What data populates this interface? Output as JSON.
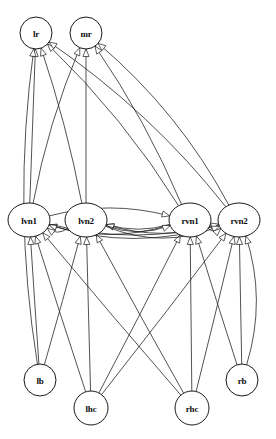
{
  "diagram": {
    "type": "directed-graph",
    "background_color": "#ffffff",
    "stroke_color": "#1a1a1a",
    "node_fill_color": "#ffffff",
    "node_radius": 16,
    "arrowhead_style": "open-triangle",
    "width": 276,
    "height": 439
  },
  "nodes": [
    {
      "id": "lr",
      "label": "lr",
      "x": 36,
      "y": 33,
      "rx": 16,
      "ry": 16,
      "row": "top"
    },
    {
      "id": "mr",
      "label": "mr",
      "x": 86,
      "y": 33,
      "rx": 16,
      "ry": 16,
      "row": "top"
    },
    {
      "id": "lvn1",
      "label": "lvn1",
      "x": 29,
      "y": 220,
      "rx": 21,
      "ry": 17,
      "row": "middle"
    },
    {
      "id": "lvn2",
      "label": "lvn2",
      "x": 86,
      "y": 220,
      "rx": 21,
      "ry": 17,
      "row": "middle"
    },
    {
      "id": "rvn1",
      "label": "rvn1",
      "x": 190,
      "y": 220,
      "rx": 21,
      "ry": 17,
      "row": "middle"
    },
    {
      "id": "rvn2",
      "label": "rvn2",
      "x": 239,
      "y": 220,
      "rx": 21,
      "ry": 17,
      "row": "middle"
    },
    {
      "id": "lb",
      "label": "lb",
      "x": 40,
      "y": 380,
      "rx": 16,
      "ry": 16,
      "row": "bottom"
    },
    {
      "id": "lhc",
      "label": "lhc",
      "x": 91,
      "y": 408,
      "rx": 17,
      "ry": 17,
      "row": "bottom"
    },
    {
      "id": "rhc",
      "label": "rhc",
      "x": 192,
      "y": 408,
      "rx": 17,
      "ry": 17,
      "row": "bottom"
    },
    {
      "id": "rb",
      "label": "rb",
      "x": 242,
      "y": 380,
      "rx": 16,
      "ry": 16,
      "row": "bottom"
    }
  ],
  "edges": [
    {
      "from": "lvn1",
      "to": "lr",
      "curve": 0
    },
    {
      "from": "lvn2",
      "to": "lr",
      "curve": 6
    },
    {
      "from": "rvn1",
      "to": "lr",
      "curve": 14
    },
    {
      "from": "rvn2",
      "to": "lr",
      "curve": 20
    },
    {
      "from": "lvn1",
      "to": "mr",
      "curve": -10
    },
    {
      "from": "lvn2",
      "to": "mr",
      "curve": 0
    },
    {
      "from": "rvn1",
      "to": "mr",
      "curve": 10
    },
    {
      "from": "rvn2",
      "to": "mr",
      "curve": 22
    },
    {
      "from": "lb",
      "to": "lr",
      "curve": -26
    },
    {
      "from": "lb",
      "to": "lvn1",
      "curve": 0
    },
    {
      "from": "lb",
      "to": "lvn2",
      "curve": 0
    },
    {
      "from": "rb",
      "to": "rvn2",
      "curve": 0
    },
    {
      "from": "rb",
      "to": "rvn1",
      "curve": 0
    },
    {
      "from": "rb",
      "to": "rvn2",
      "curve": 26
    },
    {
      "from": "lhc",
      "to": "lvn1",
      "curve": 0
    },
    {
      "from": "lhc",
      "to": "lvn2",
      "curve": 0
    },
    {
      "from": "lhc",
      "to": "rvn1",
      "curve": 0
    },
    {
      "from": "lhc",
      "to": "rvn2",
      "curve": 0
    },
    {
      "from": "rhc",
      "to": "lvn1",
      "curve": 0
    },
    {
      "from": "rhc",
      "to": "lvn2",
      "curve": 0
    },
    {
      "from": "rhc",
      "to": "rvn1",
      "curve": 0
    },
    {
      "from": "rhc",
      "to": "rvn2",
      "curve": 0
    },
    {
      "from": "lvn2",
      "to": "lvn1",
      "curve": -16
    },
    {
      "from": "rvn1",
      "to": "lvn1",
      "curve": -24
    },
    {
      "from": "rvn2",
      "to": "lvn1",
      "curve": -32
    },
    {
      "from": "rvn1",
      "to": "lvn2",
      "curve": -14
    },
    {
      "from": "rvn2",
      "to": "lvn2",
      "curve": -22
    },
    {
      "from": "lvn1",
      "to": "rvn1",
      "curve": -20
    },
    {
      "from": "lvn1",
      "to": "rvn2",
      "curve": 26
    },
    {
      "from": "lvn2",
      "to": "rvn1",
      "curve": 18
    },
    {
      "from": "lvn2",
      "to": "rvn2",
      "curve": 30
    },
    {
      "from": "rvn1",
      "to": "rvn2",
      "curve": 14
    }
  ]
}
